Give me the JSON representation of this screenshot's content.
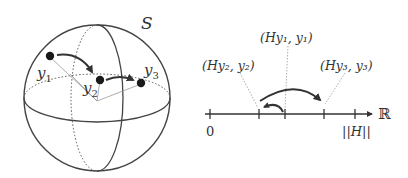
{
  "sphere": {
    "label": "S",
    "points": [
      {
        "name": "y",
        "sub": "1"
      },
      {
        "name": "y",
        "sub": "2"
      },
      {
        "name": "y",
        "sub": "3"
      }
    ]
  },
  "number_line": {
    "axis_label": "ℝ",
    "tick_labels": {
      "zero": "0",
      "norm": "||H||"
    },
    "annotations": [
      {
        "text": "(Hy₁, y₁)"
      },
      {
        "text": "(Hy₂, y₂)"
      },
      {
        "text": "(Hy₃, y₃)"
      }
    ]
  },
  "colors": {
    "stroke": "#333333",
    "thin": "#999999",
    "point": "#1a1a1a"
  }
}
